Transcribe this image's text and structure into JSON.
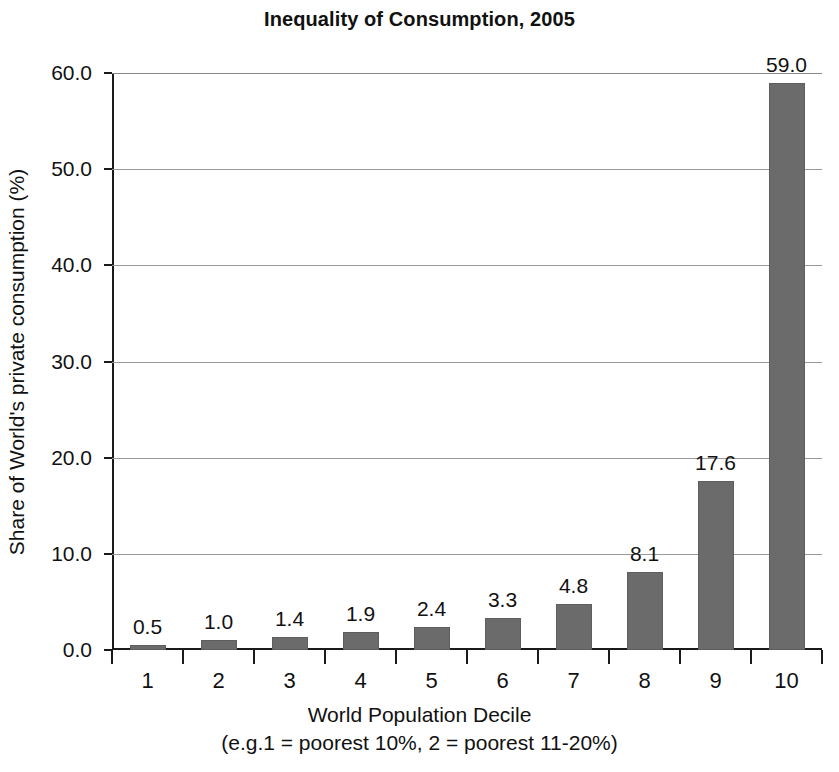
{
  "chart_data": {
    "type": "bar",
    "title": "Inequality of Consumption, 2005",
    "xlabel": "World Population Decile",
    "xsublabel": "(e.g.1 = poorest 10%, 2 = poorest 11-20%)",
    "ylabel": "Share of World's private consumption (%)",
    "categories": [
      "1",
      "2",
      "3",
      "4",
      "5",
      "6",
      "7",
      "8",
      "9",
      "10"
    ],
    "values": [
      0.5,
      1.0,
      1.4,
      1.9,
      2.4,
      3.3,
      4.8,
      8.1,
      17.6,
      59.0
    ],
    "value_labels": [
      "0.5",
      "1.0",
      "1.4",
      "1.9",
      "2.4",
      "3.3",
      "4.8",
      "8.1",
      "17.6",
      "59.0"
    ],
    "ylim": [
      0.0,
      60.0
    ],
    "yticks": [
      0.0,
      10.0,
      20.0,
      30.0,
      40.0,
      50.0,
      60.0
    ],
    "ytick_labels": [
      "0.0",
      "10.0",
      "20.0",
      "30.0",
      "40.0",
      "50.0",
      "60.0"
    ],
    "grid": true,
    "legend": false,
    "bar_color": "#6b6b6b",
    "axis_color": "#1a1a1a",
    "grid_color": "#9a9a9a",
    "background": "#ffffff"
  }
}
